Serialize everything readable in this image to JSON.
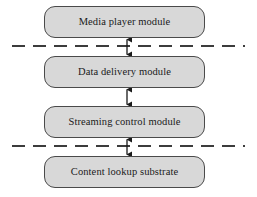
{
  "diagram": {
    "type": "layered-architecture-stack",
    "background_color": "#ffffff",
    "box_fill_color": "#d8d8d8",
    "box_border_color": "#4a4a4a",
    "text_color": "#1a1a1a",
    "dashed_line_color": "#3c3c3c",
    "arrow_color": "#1a1a1a",
    "modules": [
      {
        "label": "Media player module",
        "x": 44,
        "y": 6,
        "width": 161,
        "height": 32
      },
      {
        "label": "Data delivery module",
        "x": 44,
        "y": 56,
        "width": 161,
        "height": 32
      },
      {
        "label": "Streaming control module",
        "x": 44,
        "y": 106,
        "width": 161,
        "height": 32
      },
      {
        "label": "Content lookup substrate",
        "x": 44,
        "y": 156,
        "width": 161,
        "height": 32
      }
    ],
    "connectors": [
      {
        "from": "Media player module",
        "to": "Data delivery module",
        "style": "double-headed-arrow",
        "x": 127,
        "y_top": 38,
        "y_bottom": 56
      },
      {
        "from": "Data delivery module",
        "to": "Streaming control module",
        "style": "double-headed-arrow",
        "x": 127,
        "y_top": 88,
        "y_bottom": 106
      },
      {
        "from": "Streaming control module",
        "to": "Content lookup substrate",
        "style": "double-headed-arrow",
        "x": 127,
        "y_top": 138,
        "y_bottom": 156
      }
    ],
    "dashed_separators": [
      {
        "y": 46,
        "x_start": 12,
        "x_end": 245
      },
      {
        "y": 146,
        "x_start": 12,
        "x_end": 245
      }
    ]
  }
}
